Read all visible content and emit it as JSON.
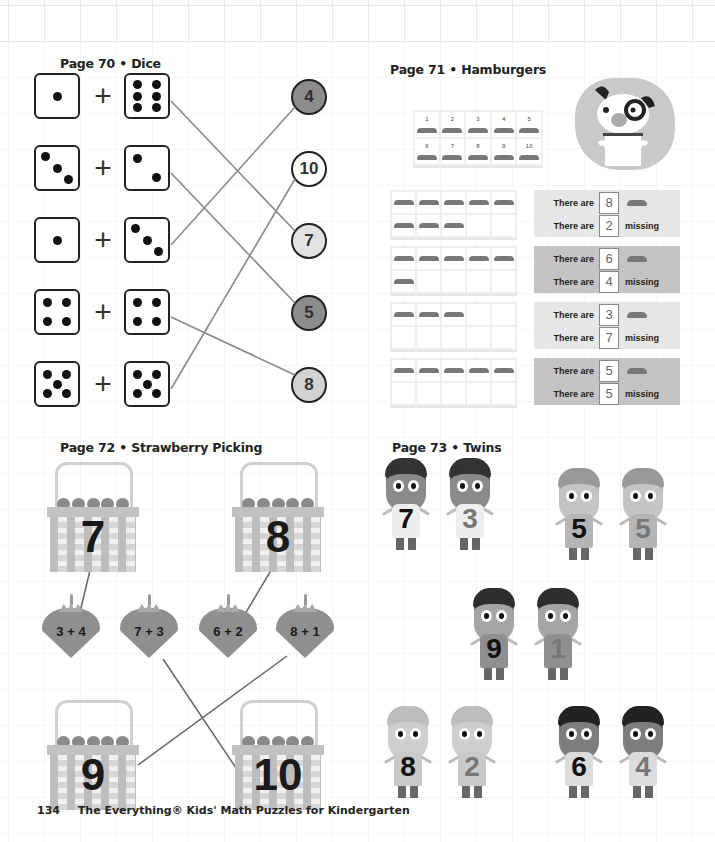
{
  "footer": {
    "page_number": "134",
    "book_title": "The Everything® Kids' Math Puzzles for Kindergarten"
  },
  "sections": {
    "dice": {
      "title": "Page 70 • Dice",
      "problems": [
        {
          "left": 1,
          "right": 6,
          "answer": 7
        },
        {
          "left": 3,
          "right": 2,
          "answer": 5
        },
        {
          "left": 1,
          "right": 3,
          "answer": 4
        },
        {
          "left": 4,
          "right": 4,
          "answer": 8
        },
        {
          "left": 5,
          "right": 5,
          "answer": 10
        }
      ],
      "plus_sign": "+",
      "answers": [
        {
          "value": "4",
          "fill": "#8c8c8c"
        },
        {
          "value": "10",
          "fill": "#ffffff"
        },
        {
          "value": "7",
          "fill": "#e3e3e3"
        },
        {
          "value": "5",
          "fill": "#8c8c8c"
        },
        {
          "value": "8",
          "fill": "#d2d2d2"
        }
      ]
    },
    "hamburgers": {
      "title": "Page 71 • Hamburgers",
      "reference_tray": [
        "1",
        "2",
        "3",
        "4",
        "5",
        "6",
        "7",
        "8",
        "9",
        "10"
      ],
      "rows": [
        {
          "present": 8,
          "missing": 2,
          "label_present": "There are",
          "label_missing": "There are",
          "missing_text": "missing",
          "panel_color": "#e6e6e6"
        },
        {
          "present": 6,
          "missing": 4,
          "label_present": "There are",
          "label_missing": "There are",
          "missing_text": "missing",
          "panel_color": "#c4c4c4"
        },
        {
          "present": 3,
          "missing": 7,
          "label_present": "There are",
          "label_missing": "There are",
          "missing_text": "missing",
          "panel_color": "#e6e6e6"
        },
        {
          "present": 5,
          "missing": 5,
          "label_present": "There are",
          "label_missing": "There are",
          "missing_text": "missing",
          "panel_color": "#c4c4c4"
        }
      ]
    },
    "strawberry": {
      "title": "Page 72 • Strawberry Picking",
      "baskets_top": [
        "7",
        "8"
      ],
      "strawberries": [
        "3 + 4",
        "7 + 3",
        "6 + 2",
        "8 + 1"
      ],
      "baskets_bottom": [
        "9",
        "10"
      ]
    },
    "twins": {
      "title": "Page 73 • Twins",
      "pairs": [
        {
          "a": "7",
          "b": "3",
          "type": "boy-dark"
        },
        {
          "a": "5",
          "b": "5",
          "type": "girl-light"
        },
        {
          "a": "9",
          "b": "1",
          "type": "girl-dark"
        },
        {
          "a": "8",
          "b": "2",
          "type": "boy-light"
        },
        {
          "a": "6",
          "b": "4",
          "type": "girl-pigtail"
        }
      ]
    }
  }
}
